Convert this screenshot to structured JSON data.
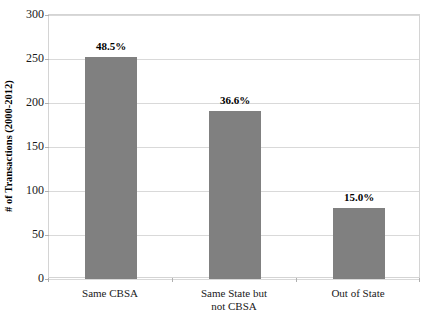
{
  "chart_data": {
    "type": "bar",
    "title": "",
    "xlabel": "",
    "ylabel": "# of Transactions (2000-2012)",
    "categories": [
      "Same CBSA",
      "Same State but not CBSA",
      "Out of State"
    ],
    "category_lines": [
      [
        "Same CBSA"
      ],
      [
        "Same State but",
        "not CBSA"
      ],
      [
        "Out of State"
      ]
    ],
    "values": [
      252,
      191,
      81
    ],
    "data_labels": [
      "48.5%",
      "36.6%",
      "15.0%"
    ],
    "ylim": [
      0,
      300
    ],
    "yticks": [
      0,
      50,
      100,
      150,
      200,
      250,
      300
    ],
    "ytick_labels": [
      "0",
      "50",
      "100",
      "150",
      "200",
      "250",
      "300"
    ],
    "grid": true,
    "legend": false,
    "bar_color": "#808080",
    "gridline_color": "#D9D9D9",
    "plot_border_color": "#D4D4D4",
    "text_color": "#1A1A1A"
  }
}
